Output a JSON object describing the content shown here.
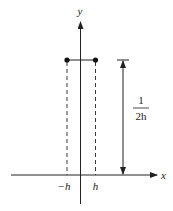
{
  "diagram": {
    "axes": {
      "x_label": "x",
      "y_label": "y"
    },
    "x_ticks": [
      {
        "label": "−h",
        "value": "-h"
      },
      {
        "label": "h",
        "value": "h"
      }
    ],
    "height_annotation": {
      "numerator": "1",
      "denominator": "2h"
    },
    "colors": {
      "line": "#222222",
      "background": "#ffffff"
    }
  }
}
